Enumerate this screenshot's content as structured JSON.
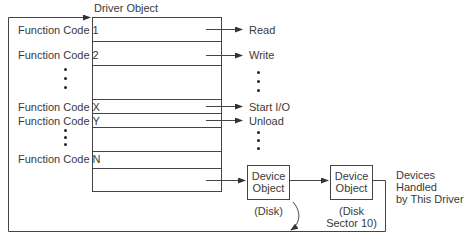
{
  "title": "Driver Object",
  "function_codes": [
    {
      "label": "Function Code 1",
      "target": "Read"
    },
    {
      "label": "Function Code 2",
      "target": "Write"
    },
    {
      "label": "Function Code X",
      "target": "Start I/O"
    },
    {
      "label": "Function Code Y",
      "target": "Unload"
    },
    {
      "label": "Function Code N",
      "target": ""
    }
  ],
  "devices": [
    {
      "label": "Device Object",
      "line1": "Device",
      "line2": "Object",
      "caption_line1": "(Disk)",
      "caption_line2": ""
    },
    {
      "label": "Device Object",
      "line1": "Device",
      "line2": "Object",
      "caption_line1": "(Disk",
      "caption_line2": "Sector 10)"
    }
  ],
  "devices_note": {
    "line1": "Devices",
    "line2": "Handled",
    "line3": "by This Driver"
  },
  "colors": {
    "line": "#333333",
    "text": "#3a3a3a",
    "background": "#ffffff"
  }
}
